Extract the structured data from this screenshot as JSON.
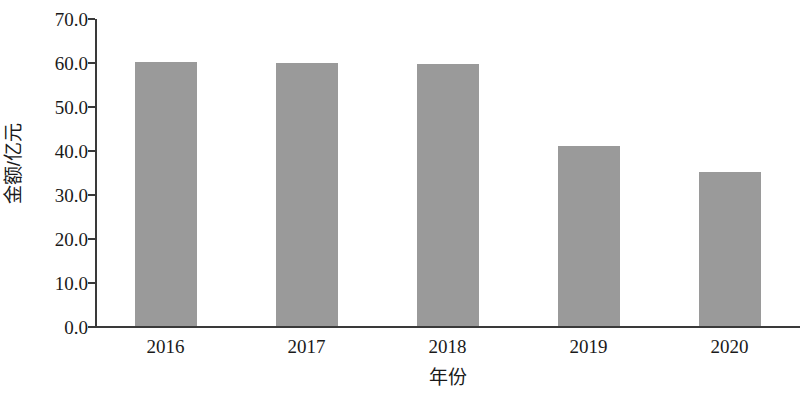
{
  "chart_data": {
    "type": "bar",
    "title": "",
    "subtitle": "",
    "categories": [
      "2016",
      "2017",
      "2018",
      "2019",
      "2020"
    ],
    "values": [
      60.0,
      59.8,
      59.6,
      41.0,
      35.0
    ],
    "xlabel": "年份",
    "ylabel": "金额/亿元",
    "ylim": [
      0.0,
      70.0
    ],
    "ytick_step": 10.0,
    "ytick_labels": [
      "70.0",
      "60.0",
      "50.0",
      "40.0",
      "30.0",
      "20.0",
      "10.0",
      "0.0"
    ],
    "ytick_values": [
      70.0,
      60.0,
      50.0,
      40.0,
      30.0,
      20.0,
      10.0,
      0.0
    ],
    "grid": false,
    "legend": null,
    "legend_position": "none",
    "bar_color": "#9a9a9a",
    "axis_color": "#3a3a3a",
    "text_color": "#1a1a1a",
    "background_color": "#ffffff"
  }
}
